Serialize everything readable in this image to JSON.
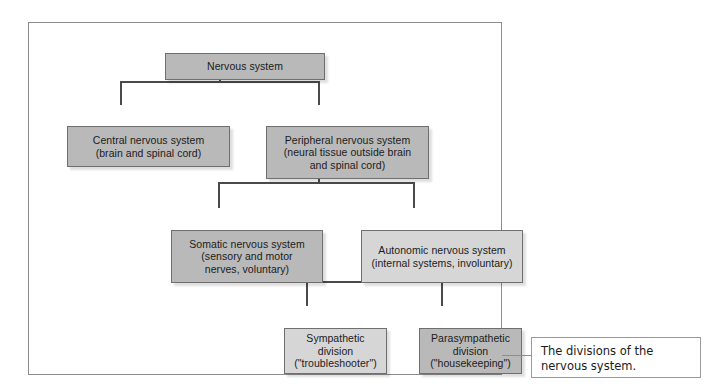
{
  "figure": {
    "caption": "The divisions of the\nnervous system.",
    "frame_border_color": "#8d8d8d",
    "connector_color": "#4a4a4a"
  },
  "diagram": {
    "type": "hierarchy-tree",
    "levels": 4,
    "nodes": [
      {
        "id": "nervous-system",
        "label": "Nervous system",
        "level": 0,
        "tone": "dark",
        "fill": "#b9b9b9"
      },
      {
        "id": "central",
        "label": "Central nervous system\n(brain and spinal cord)",
        "level": 1,
        "tone": "dark",
        "fill": "#b9b9b9"
      },
      {
        "id": "peripheral",
        "label": "Peripheral nervous system\n(neural tissue outside brain\nand spinal cord)",
        "level": 1,
        "tone": "dark",
        "fill": "#b9b9b9"
      },
      {
        "id": "somatic",
        "label": "Somatic nervous system\n(sensory and motor\nnerves, voluntary)",
        "level": 2,
        "tone": "dark",
        "fill": "#b9b9b9"
      },
      {
        "id": "autonomic",
        "label": "Autonomic nervous system\n(internal systems, involuntary)",
        "level": 2,
        "tone": "light",
        "fill": "#d6d6d6"
      },
      {
        "id": "sympathetic",
        "label": "Sympathetic\ndivision\n(\"troubleshooter\")",
        "level": 3,
        "tone": "light",
        "fill": "#d6d6d6"
      },
      {
        "id": "parasympathetic",
        "label": "Parasympathetic\ndivision\n(\"housekeeping\")",
        "level": 3,
        "tone": "dark",
        "fill": "#b9b9b9"
      }
    ],
    "edges": [
      {
        "from": "nervous-system",
        "to": "central"
      },
      {
        "from": "nervous-system",
        "to": "peripheral"
      },
      {
        "from": "peripheral",
        "to": "somatic"
      },
      {
        "from": "peripheral",
        "to": "autonomic"
      },
      {
        "from": "autonomic",
        "to": "sympathetic"
      },
      {
        "from": "autonomic",
        "to": "parasympathetic"
      }
    ]
  }
}
